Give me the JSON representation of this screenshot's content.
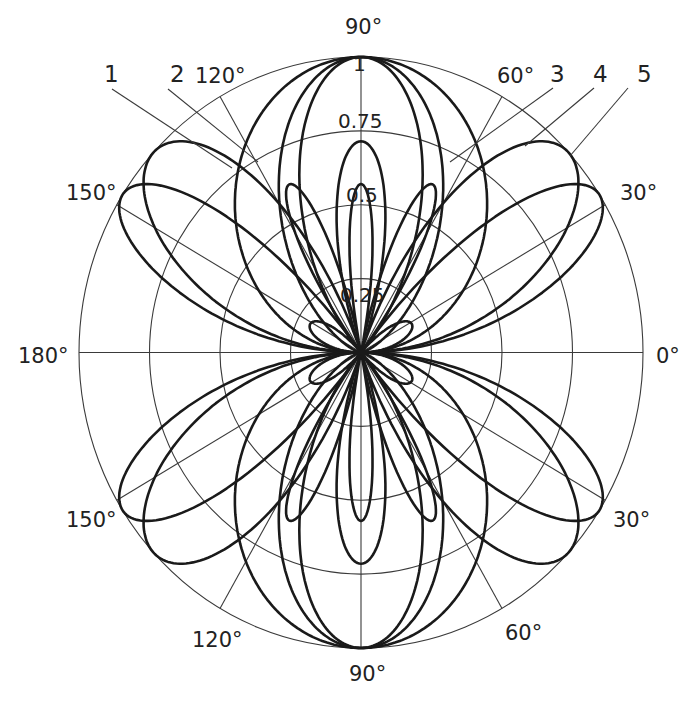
{
  "chart_data": {
    "type": "polar-line",
    "title": "",
    "radial_axis": {
      "range": [
        0,
        1
      ],
      "ticks": [
        0.25,
        0.5,
        0.75,
        1
      ],
      "tick_labels": [
        "0.25",
        "0.5",
        "0.75",
        "1"
      ],
      "label_angle_deg": 90
    },
    "angular_axis": {
      "upper_tick_labels": [
        {
          "angle": 0,
          "label": "0°"
        },
        {
          "angle": 30,
          "label": "30°"
        },
        {
          "angle": 60,
          "label": "60°"
        },
        {
          "angle": 90,
          "label": "90°"
        },
        {
          "angle": 120,
          "label": "120°"
        },
        {
          "angle": 150,
          "label": "150°"
        },
        {
          "angle": 180,
          "label": "180°"
        }
      ],
      "lower_tick_labels": [
        {
          "angle": -30,
          "label": "30°"
        },
        {
          "angle": -60,
          "label": "60°"
        },
        {
          "angle": -90,
          "label": "90°"
        },
        {
          "angle": -120,
          "label": "120°"
        },
        {
          "angle": -150,
          "label": "150°"
        }
      ],
      "radial_lines_deg": [
        0,
        30,
        60,
        90,
        120,
        150,
        180,
        210,
        240,
        270,
        300,
        330
      ]
    },
    "series": [
      {
        "name": "1",
        "description": "Side lobe toward ~145° (and mirrored lobes), main lobe along 90°",
        "main_lobe_angles_deg": [
          90,
          270
        ],
        "side_lobe_angles_deg": [
          145,
          35,
          215,
          325
        ],
        "side_lobe_peak": 0.82,
        "inner_notch_r": 0.3,
        "model_L_over_lambda": 2.5
      },
      {
        "name": "2",
        "description": "Side lobe toward ~120°, main lobe along 90°",
        "main_lobe_angles_deg": [
          90,
          270
        ],
        "side_lobe_angles_deg": [
          120,
          60,
          240,
          300
        ],
        "side_lobe_peak": 0.9,
        "inner_notch_r": 0.27,
        "model_L_over_lambda": 1.5
      },
      {
        "name": "3",
        "description": "Single broad lobe along 90°",
        "main_lobe_angles_deg": [
          90,
          270
        ],
        "peak": 1.0,
        "model_L_over_lambda": 0.5
      },
      {
        "name": "4",
        "description": "Broad lobe along 90°, wider",
        "main_lobe_angles_deg": [
          90,
          270
        ],
        "peak": 1.0,
        "model_L_over_lambda": 1.0
      },
      {
        "name": "5",
        "description": "Widest broadside lobe along 90°",
        "main_lobe_angles_deg": [
          90,
          270
        ],
        "peak": 1.0,
        "model_L_over_lambda": 1.2
      }
    ],
    "legend": {
      "position": "top",
      "entries": [
        "1",
        "2",
        "3",
        "4",
        "5"
      ]
    },
    "grid": true
  },
  "labels": {
    "ring_0_25": "0.25",
    "ring_0_5": "0.5",
    "ring_0_75": "0.75",
    "ring_1": "1",
    "deg_0": "0°",
    "deg_30_top": "30°",
    "deg_60_top": "60°",
    "deg_90_top": "90°",
    "deg_120_top": "120°",
    "deg_150_top": "150°",
    "deg_180": "180°",
    "deg_150_bottom": "150°",
    "deg_120_bottom": "120°",
    "deg_90_bottom": "90°",
    "deg_60_bottom": "60°",
    "deg_30_bottom": "30°",
    "curve_1": "1",
    "curve_2": "2",
    "curve_3": "3",
    "curve_4": "4",
    "curve_5": "5"
  },
  "geometry": {
    "cx": 361,
    "cy": 352.5,
    "rx": 282,
    "ry": 295.5
  }
}
